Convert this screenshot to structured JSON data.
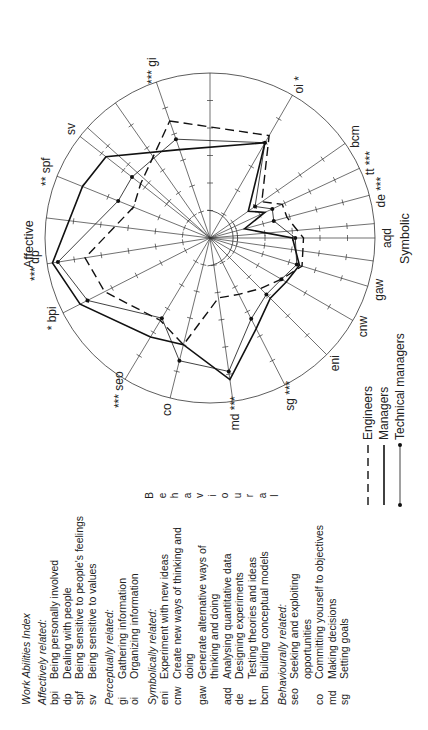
{
  "chart_data": {
    "type": "radar",
    "scale_max": 6,
    "groups": [
      "Affective",
      "Symbolic",
      "Behavioural"
    ],
    "axes": [
      {
        "key": "gi",
        "sig": "***"
      },
      {
        "key": "oi",
        "sig": "*"
      },
      {
        "key": "bcm",
        "sig": ""
      },
      {
        "key": "tt",
        "sig": "***"
      },
      {
        "key": "de",
        "sig": "***"
      },
      {
        "key": "aqd",
        "sig": ""
      },
      {
        "key": "gaw",
        "sig": ""
      },
      {
        "key": "cnw",
        "sig": ""
      },
      {
        "key": "eni",
        "sig": ""
      },
      {
        "key": "sg",
        "sig": "***"
      },
      {
        "key": "md",
        "sig": "***"
      },
      {
        "key": "co",
        "sig": ""
      },
      {
        "key": "seo",
        "sig": "***"
      },
      {
        "key": "bpi",
        "sig": "*"
      },
      {
        "key": "dp",
        "sig": "***"
      },
      {
        "key": "spf",
        "sig": "**"
      },
      {
        "key": "sv",
        "sig": ""
      }
    ],
    "series": [
      {
        "name": "Engineers",
        "style": "dashed",
        "values": [
          4.5,
          4.3,
          2.3,
          2.9,
          2.9,
          3.4,
          3.5,
          3.0,
          2.6,
          2.3,
          2.2,
          4.0,
          3.5,
          4.3,
          4.6,
          3.0,
          3.2
        ]
      },
      {
        "name": "Managers",
        "style": "solid",
        "values": [
          3.4,
          4.0,
          1.7,
          2.2,
          1.3,
          3.0,
          3.4,
          3.2,
          3.1,
          3.7,
          5.2,
          4.0,
          4.2,
          5.3,
          5.8,
          5.0,
          4.8
        ]
      },
      {
        "name": "Technical managers",
        "style": "dotted-marker",
        "values": [
          3.8,
          4.0,
          2.0,
          2.5,
          2.4,
          3.1,
          3.3,
          3.0,
          2.9,
          3.3,
          4.9,
          4.6,
          3.4,
          5.0,
          5.6,
          3.6,
          3.6
        ]
      }
    ],
    "legend": [
      "Engineers",
      "Managers",
      "Technical managers"
    ],
    "legend_position": "bottom-right"
  },
  "group_labels": {
    "affective": "Affective",
    "symbolic": "Symbolic",
    "behavioural": "Behavioural"
  },
  "index": {
    "title": "Work Abilities Index",
    "groups": [
      {
        "heading": "Affectively related:",
        "items": [
          {
            "abbr": "bpi",
            "desc": "Being personally involved"
          },
          {
            "abbr": "dp",
            "desc": "Dealing with people"
          },
          {
            "abbr": "spf",
            "desc": "Being sensitive to people's feelings"
          },
          {
            "abbr": "sv",
            "desc": "Being sensitive to values"
          }
        ]
      },
      {
        "heading": "Perceptually related:",
        "items": [
          {
            "abbr": "gi",
            "desc": "Gathering information"
          },
          {
            "abbr": "oi",
            "desc": "Organizing information"
          }
        ]
      },
      {
        "heading": "Symbolically related:",
        "items": [
          {
            "abbr": "eni",
            "desc": "Experiment with new ideas"
          },
          {
            "abbr": "cnw",
            "desc": "Create new ways of thinking and doing"
          },
          {
            "abbr": "gaw",
            "desc": "Generate alternative ways of thinking and doing"
          },
          {
            "abbr": "aqd",
            "desc": "Analysing quantitative data"
          },
          {
            "abbr": "de",
            "desc": "Designing experiments"
          },
          {
            "abbr": "tt",
            "desc": "Testing theories and ideas"
          },
          {
            "abbr": "bcm",
            "desc": "Building conceptual models"
          }
        ]
      },
      {
        "heading": "Behaviourally related:",
        "items": [
          {
            "abbr": "seo",
            "desc": "Seeking and exploiting opportunities"
          },
          {
            "abbr": "co",
            "desc": "Committing yourself to objectives"
          },
          {
            "abbr": "md",
            "desc": "Making decisions"
          },
          {
            "abbr": "sg",
            "desc": "Setting goals"
          }
        ]
      }
    ]
  },
  "colors": {
    "ink": "#222222",
    "background": "#ffffff"
  }
}
